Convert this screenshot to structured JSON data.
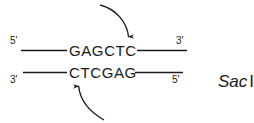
{
  "figure": {
    "background_color": "#ffffff",
    "stroke_color": "#1a1a1a"
  },
  "enzyme": {
    "name": "Sac",
    "numeral": "I"
  },
  "strands": {
    "top": {
      "sequence": "GAGCTC",
      "left_end_label": "5'",
      "right_end_label": "3'"
    },
    "bottom": {
      "sequence": "CTCGAG",
      "left_end_label": "3'",
      "right_end_label": "5'"
    }
  },
  "cut_arrows": [
    {
      "id": "top-cut-arrow",
      "strand": "top",
      "direction": "downward",
      "cut_after_base_index": 5,
      "cut_between": "T and C"
    },
    {
      "id": "bottom-cut-arrow",
      "strand": "bottom",
      "direction": "upward",
      "cut_after_base_index": 1,
      "cut_between": "C and T"
    }
  ]
}
